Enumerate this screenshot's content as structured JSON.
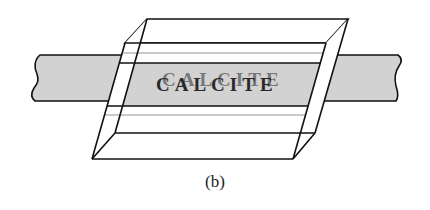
{
  "figure": {
    "label_text": "CALCITE",
    "label_double_text": "CALCITE",
    "caption": "(b)",
    "colors": {
      "band_fill": "#d2d2d2",
      "line": "#111111",
      "text": "#2a2a2a",
      "background": "#ffffff"
    }
  }
}
